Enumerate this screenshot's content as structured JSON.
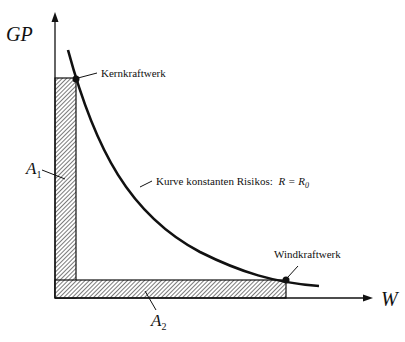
{
  "axes": {
    "y_label": "GP",
    "x_label": "W"
  },
  "areas": [
    {
      "label": "A",
      "subscript": "1"
    },
    {
      "label": "A",
      "subscript": "2"
    }
  ],
  "points": [
    {
      "label": "Kernkraftwerk"
    },
    {
      "label": "Windkraftwerk"
    }
  ],
  "curve": {
    "label": "Kurve konstanten Risikos:",
    "formula_lhs": "R",
    "formula_eq": "=",
    "formula_rhs": "R",
    "formula_rhs_sub": "0"
  }
}
